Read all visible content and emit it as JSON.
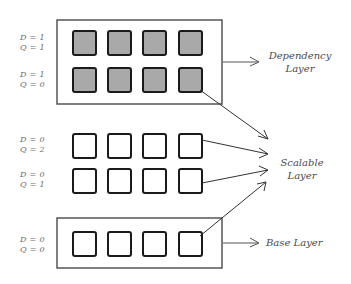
{
  "diagram": {
    "rows": [
      {
        "d_label": "D = 1",
        "q_label": "Q = 1",
        "filled": true
      },
      {
        "d_label": "D = 1",
        "q_label": "Q = 0",
        "filled": true
      },
      {
        "d_label": "D = 0",
        "q_label": "Q = 2",
        "filled": false
      },
      {
        "d_label": "D = 0",
        "q_label": "Q = 1",
        "filled": false
      },
      {
        "d_label": "D = 0",
        "q_label": "Q = 0",
        "filled": false
      }
    ],
    "layers": {
      "dependency": {
        "line1": "Dependency",
        "line2": "Layer"
      },
      "scalable": {
        "line1": "Scalable",
        "line2": "Layer"
      },
      "base": {
        "line1": "Base Layer"
      }
    },
    "colors": {
      "filled_square": "#a9a9a9",
      "stroke": "#1a1a1a",
      "box_stroke": "#555555",
      "arrow": "#333333"
    }
  }
}
